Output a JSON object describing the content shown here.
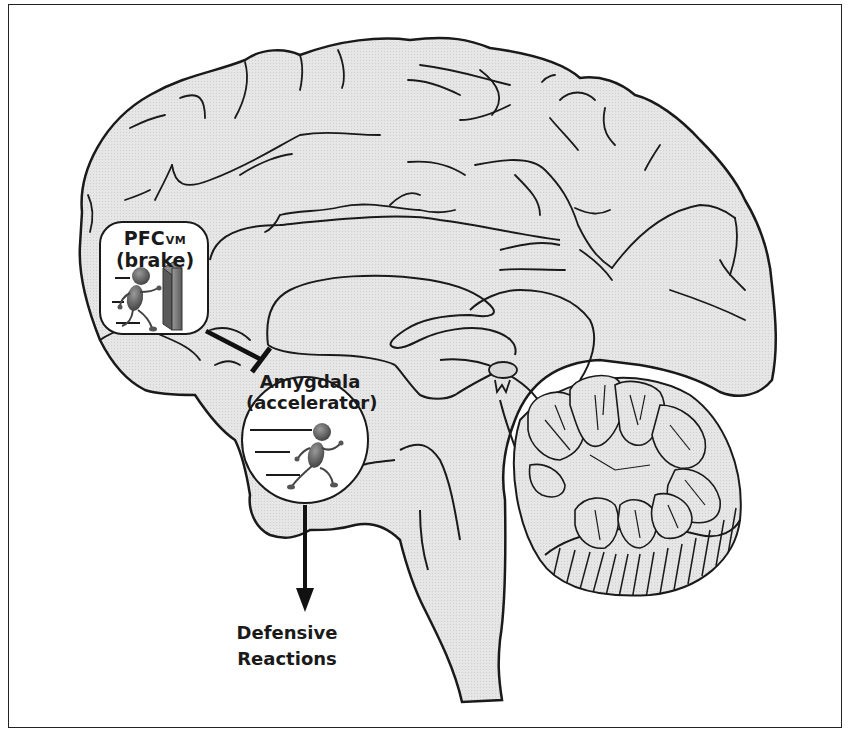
{
  "diagram": {
    "type": "brain-sagittal-section",
    "nodes": {
      "pfc": {
        "title_main": "PFC",
        "title_subscript": "VM",
        "role": "(brake)",
        "icon": "running-figure-hitting-wall-icon"
      },
      "amygdala": {
        "title": "Amygdala",
        "role": "(accelerator)",
        "icon": "running-figure-icon"
      },
      "output": {
        "line1": "Defensive",
        "line2": "Reactions"
      }
    },
    "edges": [
      {
        "from": "pfc",
        "to": "amygdala",
        "type": "inhibitory",
        "marker": "flat-bar"
      },
      {
        "from": "amygdala",
        "to": "output",
        "type": "excitatory",
        "marker": "arrowhead"
      }
    ],
    "colors": {
      "brain_fill": "#e4e4e4",
      "outline": "#1a1a1a",
      "box_fill": "#ffffff",
      "figure_fill": "#5a5a5a",
      "wall_fill": "#7a7a7a"
    }
  }
}
